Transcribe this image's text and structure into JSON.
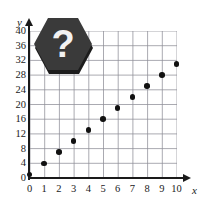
{
  "figure": {
    "badge": {
      "icon": "hexagon-question-badge",
      "glyph": "?",
      "fill": "#3a3a3a",
      "shadow": "#1c1c1c",
      "glyph_color": "#f2f2f2"
    },
    "colors": {
      "axis": "#1a1a1a",
      "grid": "#8e8e97",
      "point": "#111111",
      "background": "#ffffff"
    }
  },
  "chart_data": {
    "type": "scatter",
    "title": "",
    "xlabel": "x",
    "ylabel": "y",
    "xlim": [
      0,
      10
    ],
    "ylim": [
      0,
      40
    ],
    "grid": true,
    "legend": null,
    "x_ticks": [
      0,
      1,
      2,
      3,
      4,
      5,
      6,
      7,
      8,
      9,
      10
    ],
    "x_tick_labels": [
      "0",
      "1",
      "2",
      "3",
      "4",
      "5",
      "6",
      "7",
      "8",
      "9",
      "10"
    ],
    "y_ticks": [
      0,
      4,
      8,
      12,
      16,
      20,
      24,
      28,
      32,
      36,
      40
    ],
    "y_tick_labels": [
      "0",
      "4",
      "8",
      "12",
      "16",
      "20",
      "24",
      "28",
      "32",
      "36",
      "40"
    ],
    "x_minor_step": 1,
    "y_minor_step": 4,
    "x": [
      0,
      1,
      2,
      3,
      4,
      5,
      6,
      7,
      8,
      9,
      10
    ],
    "values": [
      1,
      4,
      7,
      10,
      13,
      16,
      19,
      22,
      25,
      28,
      31
    ],
    "points": [
      {
        "x": 0,
        "y": 1
      },
      {
        "x": 1,
        "y": 4
      },
      {
        "x": 2,
        "y": 7
      },
      {
        "x": 3,
        "y": 10
      },
      {
        "x": 4,
        "y": 13
      },
      {
        "x": 5,
        "y": 16
      },
      {
        "x": 6,
        "y": 19
      },
      {
        "x": 7,
        "y": 22
      },
      {
        "x": 8,
        "y": 25
      },
      {
        "x": 9,
        "y": 28
      },
      {
        "x": 10,
        "y": 31
      }
    ]
  }
}
